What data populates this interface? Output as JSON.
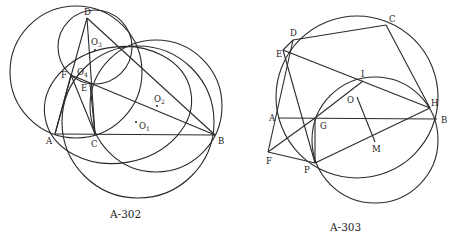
{
  "figures": [
    {
      "id": "A-302",
      "caption": "A-302",
      "points": {
        "A": "A",
        "B": "B",
        "C": "C",
        "D": "D",
        "E": "E",
        "F": "F",
        "O1": "O",
        "O1_sub": "1",
        "O2": "O",
        "O2_sub": "2",
        "O3": "O",
        "O3_sub": "3",
        "O4": "O",
        "O4_sub": "4"
      }
    },
    {
      "id": "A-303",
      "caption": "A-303",
      "points": {
        "A": "A",
        "B": "B",
        "C": "C",
        "D": "D",
        "E": "E",
        "F": "F",
        "G": "G",
        "H": "H",
        "I": "I",
        "M": "M",
        "O": "O",
        "P": "P"
      }
    }
  ],
  "colors": {
    "stroke": "#2a2a2a",
    "background": "#ffffff"
  }
}
